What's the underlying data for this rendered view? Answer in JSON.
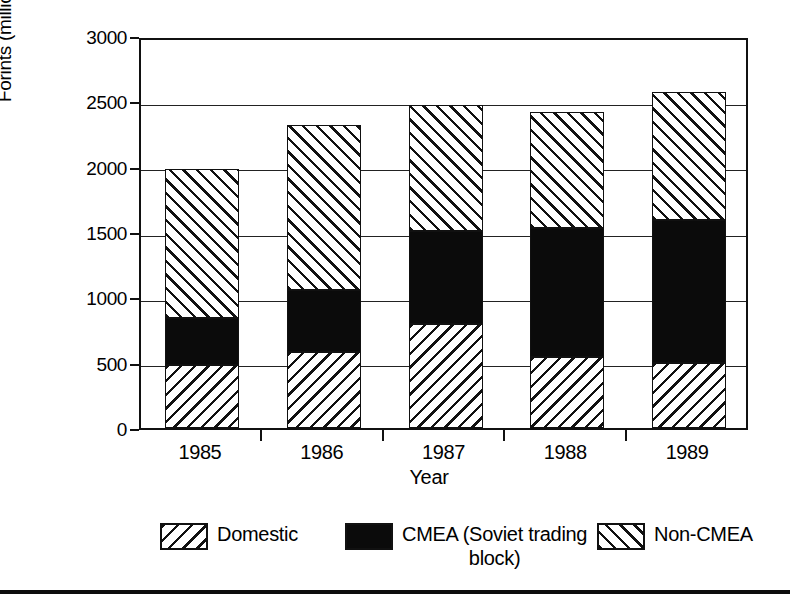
{
  "chart_data": {
    "type": "bar",
    "subtype": "stacked-vertical",
    "title": "",
    "xlabel": "Year",
    "ylabel": "Forints (millions)",
    "categories": [
      "1985",
      "1986",
      "1987",
      "1988",
      "1989"
    ],
    "ylim": [
      0,
      3000
    ],
    "yticks": [
      0,
      500,
      1000,
      1500,
      2000,
      2500,
      3000
    ],
    "ytick_labels": [
      "0",
      "500",
      "1000",
      "1500",
      "2000",
      "2500",
      "3000"
    ],
    "grid": true,
    "grid_axis": "y",
    "legend_position": "bottom",
    "series": [
      {
        "name": "Domestic",
        "pattern": "diagonal-hatch-backslash",
        "color": "#ffffff",
        "values": [
          480,
          585,
          795,
          540,
          500
        ]
      },
      {
        "name": "CMEA (Soviet trading block)",
        "pattern": "solid-black",
        "color": "#0b0b0b",
        "values": [
          365,
          470,
          710,
          990,
          1090
        ]
      },
      {
        "name": "Non-CMEA",
        "pattern": "diagonal-hatch-forwardslash",
        "color": "#ffffff",
        "values": [
          1140,
          1265,
          965,
          890,
          980
        ]
      }
    ],
    "cumulative_tops": [
      [
        480,
        845,
        1985
      ],
      [
        585,
        1055,
        2320
      ],
      [
        795,
        1505,
        2470
      ],
      [
        540,
        1530,
        2420
      ],
      [
        500,
        1590,
        2570
      ]
    ],
    "totals": [
      1985,
      2320,
      2470,
      2420,
      2570
    ]
  },
  "legend": {
    "items": [
      {
        "label": "Domestic",
        "swatch": "hatch-back"
      },
      {
        "label": "CMEA (Soviet trading\nblock)",
        "swatch": "solid"
      },
      {
        "label": "Non-CMEA",
        "swatch": "hatch-fwd"
      }
    ]
  },
  "axes": {
    "y_label": "Forints (millions)",
    "x_label": "Year"
  }
}
